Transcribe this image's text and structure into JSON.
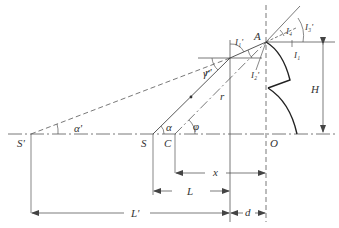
{
  "diagram": {
    "title": "",
    "colors": {
      "line": "#444444",
      "profile": "#222222",
      "text": "#333333",
      "background": "#ffffff"
    },
    "points": {
      "S_prime": "S'",
      "S": "S",
      "C": "C",
      "O": "O",
      "A": "A"
    },
    "angles": {
      "alpha_prime": "α'",
      "alpha": "α",
      "phi": "φ",
      "gamma_prime": "γ'",
      "I1_prime": "I₁'",
      "I2_prime": "I₂'",
      "I3_prime": "I₃'",
      "I4": "I₄",
      "I1": "I₁"
    },
    "segments": {
      "r_prime": "r'",
      "r": "r"
    },
    "dimensions": {
      "H": "H",
      "x": "x",
      "L": "L",
      "L_prime": "L'",
      "d": "d"
    }
  }
}
